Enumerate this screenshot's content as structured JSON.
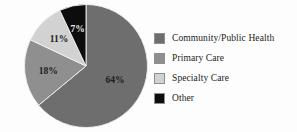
{
  "chart_data": {
    "type": "pie",
    "title": "",
    "subtitle": "",
    "xlabel": "",
    "ylabel": "",
    "grid": false,
    "legend_position": "right",
    "start_angle_deg": 0,
    "direction": "clockwise",
    "categories": [
      "Community/Public Health",
      "Primary Care",
      "Specialty Care",
      "Other"
    ],
    "values": [
      64,
      18,
      11,
      7
    ],
    "value_unit": "%",
    "data_labels": [
      "64%",
      "18%",
      "11%",
      "7%"
    ],
    "colors": [
      "#6e6e6e",
      "#8f8f8f",
      "#d2d2d2",
      "#0d0d0d"
    ],
    "slices": [
      {
        "label": "Community/Public Health",
        "value": 64,
        "data_label": "64%",
        "color": "#6e6e6e",
        "label_fill": "on-dark"
      },
      {
        "label": "Primary Care",
        "value": 18,
        "data_label": "18%",
        "color": "#8f8f8f",
        "label_fill": "on-light"
      },
      {
        "label": "Specialty Care",
        "value": 11,
        "data_label": "11%",
        "color": "#d2d2d2",
        "label_fill": "on-light"
      },
      {
        "label": "Other",
        "value": 7,
        "data_label": "7%",
        "color": "#0d0d0d",
        "label_fill": "on-black"
      }
    ]
  },
  "legend": {
    "items": [
      {
        "label": "Community/Public Health",
        "color": "#6e6e6e"
      },
      {
        "label": "Primary Care",
        "color": "#8f8f8f"
      },
      {
        "label": "Specialty Care",
        "color": "#d2d2d2"
      },
      {
        "label": "Other",
        "color": "#0d0d0d"
      }
    ]
  },
  "style": {
    "background": "#fdfdfd",
    "slice_outline": "#f2f2f2",
    "text_color": "#232323"
  }
}
